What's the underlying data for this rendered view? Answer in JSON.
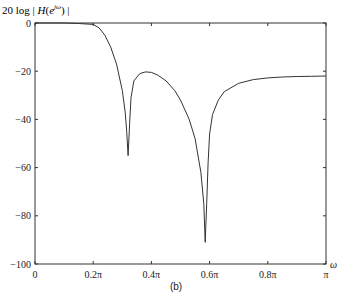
{
  "chart_data": {
    "type": "line",
    "ylabel": "20 log | H(e^{jω}) |",
    "xlabel": "ω",
    "caption": "(b)",
    "xlim": [
      0,
      1
    ],
    "ylim": [
      -100,
      0
    ],
    "grid": false,
    "legend": null,
    "x_ticks": [
      {
        "value": 0,
        "label": "0"
      },
      {
        "value": 0.2,
        "label": "0.2π"
      },
      {
        "value": 0.4,
        "label": "0.4π"
      },
      {
        "value": 0.6,
        "label": "0.6π"
      },
      {
        "value": 0.8,
        "label": "0.8π"
      },
      {
        "value": 1.0,
        "label": "π"
      }
    ],
    "y_ticks": [
      {
        "value": 0,
        "label": "0"
      },
      {
        "value": -20,
        "label": "−20"
      },
      {
        "value": -40,
        "label": "−40"
      },
      {
        "value": -60,
        "label": "−60"
      },
      {
        "value": -80,
        "label": "−80"
      },
      {
        "value": -100,
        "label": "−100"
      }
    ],
    "series": [
      {
        "name": "Magnitude response (dB)",
        "x_units": "ω/π",
        "x": [
          0,
          0.05,
          0.1,
          0.15,
          0.2,
          0.22,
          0.24,
          0.26,
          0.28,
          0.3,
          0.31,
          0.315,
          0.32,
          0.325,
          0.33,
          0.34,
          0.36,
          0.38,
          0.4,
          0.42,
          0.45,
          0.48,
          0.5,
          0.53,
          0.55,
          0.57,
          0.58,
          0.585,
          0.59,
          0.595,
          0.6,
          0.61,
          0.63,
          0.65,
          0.7,
          0.75,
          0.8,
          0.85,
          0.9,
          0.95,
          1.0
        ],
        "y": [
          0,
          0,
          0,
          -0.2,
          -0.6,
          -2,
          -5,
          -10,
          -17,
          -28,
          -37,
          -45,
          -55,
          -42,
          -31,
          -24,
          -21,
          -20.3,
          -20.5,
          -21.5,
          -24,
          -28,
          -32,
          -40,
          -48,
          -62,
          -75,
          -91,
          -75,
          -58,
          -46,
          -38,
          -32,
          -28.5,
          -25,
          -23.5,
          -22.8,
          -22.4,
          -22.2,
          -22.1,
          -22
        ]
      }
    ],
    "annotations": [
      {
        "type": "null",
        "x": 0.32,
        "y": -55
      },
      {
        "type": "null",
        "x": 0.59,
        "y": -91
      },
      {
        "type": "sidelobe-peak",
        "x": 0.39,
        "y": -20
      }
    ]
  },
  "labels": {
    "title_prefix": "20 log | ",
    "title_H": "H",
    "title_open": "(",
    "title_e": "e",
    "title_sup": "jω",
    "title_close": ") |",
    "xlabel": "ω",
    "caption": "(b)"
  }
}
